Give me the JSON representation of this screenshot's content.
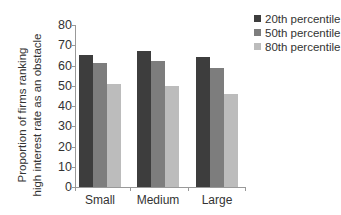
{
  "chart_data": {
    "type": "bar",
    "title": "",
    "xlabel": "",
    "ylabel": "Proportion of firms ranking high interest rate as an obstacle",
    "ylabel_lines": [
      "Proportion of firms ranking",
      "high interest rate as an obstacle"
    ],
    "ylim": [
      0,
      80
    ],
    "yticks": [
      0,
      10,
      20,
      30,
      40,
      50,
      60,
      70,
      80
    ],
    "categories": [
      "Small",
      "Medium",
      "Large"
    ],
    "series": [
      {
        "name": "20th percentile",
        "color": "#3d3d3d",
        "values": [
          65,
          67,
          64
        ]
      },
      {
        "name": "50th percentile",
        "color": "#7d7d7d",
        "values": [
          61,
          62,
          59
        ]
      },
      {
        "name": "80th percentile",
        "color": "#bcbcbc",
        "values": [
          51,
          50,
          46
        ]
      }
    ],
    "legend_position": "top-right",
    "grid": false
  }
}
